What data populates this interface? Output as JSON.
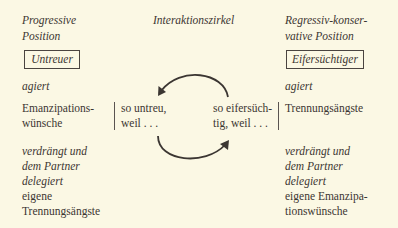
{
  "left": {
    "header": [
      "Progressive",
      "Position"
    ],
    "box_label": "Untreuer",
    "acts_label": "agiert",
    "acts_value": [
      "Emanzipations-",
      "wünsche"
    ],
    "repressed_label": [
      "verdrängt und",
      "dem Partner",
      "delegiert"
    ],
    "repressed_value": [
      "eigene",
      "Trennungsängste"
    ]
  },
  "center": {
    "title": "Interaktionszirkel",
    "left_text": [
      "so untreu,",
      "weil . . ."
    ],
    "right_text": [
      "so eifersüch-",
      "tig, weil . . ."
    ]
  },
  "right": {
    "header": [
      "Regressiv-konser-",
      "vative Position"
    ],
    "box_label": "Eifersüchtiger",
    "acts_label": "agiert",
    "acts_value": [
      "Trennungsängste"
    ],
    "repressed_label": [
      "verdrängt und",
      "dem Partner",
      "delegiert"
    ],
    "repressed_value": [
      "eigene Emanzipa-",
      "tionswünsche"
    ]
  },
  "colors": {
    "background": "#fbf8e4",
    "text": "#3b3632"
  }
}
